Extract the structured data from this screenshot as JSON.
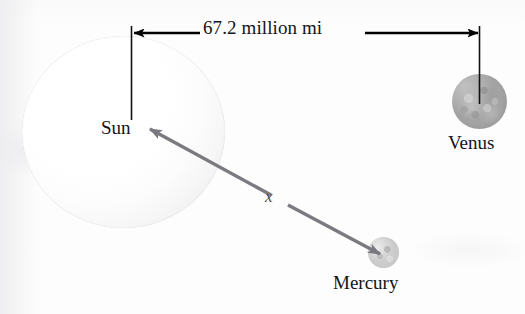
{
  "figure": {
    "type": "astronomy-distance-diagram",
    "background_color": "#fdfdfd"
  },
  "dimension_line": {
    "label": "67.2 million mi",
    "from": "Sun",
    "to": "Venus",
    "color": "#000000",
    "arrow_style": "double-headed"
  },
  "bodies": {
    "sun": {
      "label": "Sun",
      "color": "#f4f4f6"
    },
    "venus": {
      "label": "Venus",
      "color": "#a2a2a2"
    },
    "mercury": {
      "label": "Mercury",
      "color": "#cacaca"
    }
  },
  "unknown_segment": {
    "label": "x",
    "from": "Mercury",
    "to": "Sun",
    "color": "#7a7a80",
    "arrow_style": "double-headed"
  }
}
